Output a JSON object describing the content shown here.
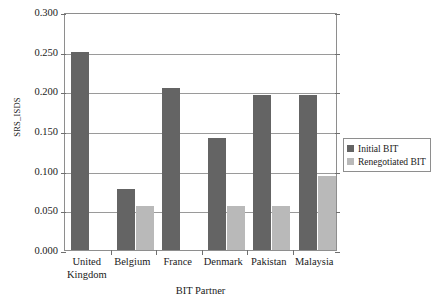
{
  "chart_data": {
    "type": "bar",
    "title": "",
    "xlabel": "BIT Partner",
    "ylabel": "SRS_ISDS",
    "categories": [
      "United Kingdom",
      "Belgium",
      "France",
      "Denmark",
      "Pakistan",
      "Malaysia"
    ],
    "series": [
      {
        "name": "Initial BIT",
        "color": "#646464",
        "values": [
          0.25,
          0.077,
          0.204,
          0.141,
          0.195,
          0.195
        ]
      },
      {
        "name": "Renegotiated BIT",
        "color": "#b9b9b9",
        "values": [
          0.0,
          0.056,
          0.0,
          0.056,
          0.056,
          0.093
        ]
      }
    ],
    "ylim": [
      0.0,
      0.3
    ],
    "ytick_values": [
      0.0,
      0.05,
      0.1,
      0.15,
      0.2,
      0.25,
      0.3
    ],
    "ytick_labels": [
      "0.000",
      "0.050",
      "0.100",
      "0.150",
      "0.200",
      "0.250",
      "0.300"
    ],
    "grid": true,
    "grid_axis": "y",
    "legend_position": "right",
    "frame": true,
    "background_color": "#ffffff",
    "axis_color": "#8e8e8e"
  }
}
